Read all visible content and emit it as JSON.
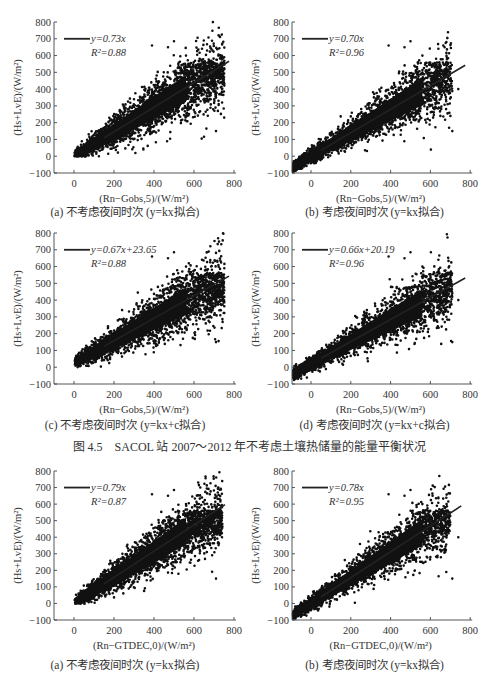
{
  "figures": [
    {
      "caption": "图 4.5　SACOL 站 2007～2012 年不考虑土壤热储量的能量平衡状况"
    }
  ],
  "chart_data": [
    {
      "id": "4.5a",
      "type": "scatter",
      "caption": "(a) 不考虑夜间时次 (y=kx拟合)",
      "xlabel": "(Rn−Gobs,5)/(W/m²)",
      "ylabel": "(Hs+LvE)/(W/m²)",
      "xlim": [
        -90,
        790
      ],
      "ylim": [
        -100,
        800
      ],
      "xticks": [
        0,
        200,
        400,
        600,
        800
      ],
      "yticks": [
        -100,
        0,
        100,
        200,
        300,
        400,
        500,
        600,
        700,
        800
      ],
      "legend": {
        "equation": "y=0.73x",
        "r2": "R²=0.88"
      },
      "fit": {
        "slope": 0.73,
        "intercept": 0,
        "x_range": [
          0,
          775
        ]
      },
      "scatter_extent": {
        "x_min": 0,
        "x_max": 770,
        "y_min": -5,
        "y_max": 690,
        "includes_night": false
      }
    },
    {
      "id": "4.5b",
      "type": "scatter",
      "caption": "(b) 考虑夜间时次 (y=kx拟合)",
      "xlabel": "(Rn−Gobs,5)/(W/m²)",
      "ylabel": "(Hs+LvE)/(W/m²)",
      "xlim": [
        -100,
        800
      ],
      "ylim": [
        -100,
        800
      ],
      "xticks": [
        0,
        200,
        400,
        600,
        800
      ],
      "yticks": [
        -100,
        0,
        100,
        200,
        300,
        400,
        500,
        600,
        700,
        800
      ],
      "legend": {
        "equation": "y=0.70x",
        "r2": "R²=0.96"
      },
      "fit": {
        "slope": 0.7,
        "intercept": 0,
        "x_range": [
          -100,
          775
        ]
      },
      "scatter_extent": {
        "x_min": -100,
        "x_max": 770,
        "y_min": -100,
        "y_max": 690,
        "includes_night": true
      }
    },
    {
      "id": "4.5c",
      "type": "scatter",
      "caption": "(c) 不考虑夜间时次 (y=kx+c拟合)",
      "xlabel": "(Rn−Gobs,5)/(W/m²)",
      "ylabel": "(Hs+LvE)/(W/m²)",
      "xlim": [
        -90,
        790
      ],
      "ylim": [
        -100,
        800
      ],
      "xticks": [
        0,
        200,
        400,
        600,
        800
      ],
      "yticks": [
        -100,
        0,
        100,
        200,
        300,
        400,
        500,
        600,
        700,
        800
      ],
      "legend": {
        "equation": "y=0.67x+23.65",
        "r2": "R²=0.88"
      },
      "fit": {
        "slope": 0.67,
        "intercept": 23.65,
        "x_range": [
          0,
          775
        ]
      },
      "scatter_extent": {
        "x_min": 0,
        "x_max": 770,
        "y_min": -5,
        "y_max": 690,
        "includes_night": false
      }
    },
    {
      "id": "4.5d",
      "type": "scatter",
      "caption": "(d) 考虑夜间时次 (y=kx+c拟合)",
      "xlabel": "(Rn−Gobs,5)/(W/m²)",
      "ylabel": "(Hs+LvE)/(W/m²)",
      "xlim": [
        -100,
        800
      ],
      "ylim": [
        -100,
        800
      ],
      "xticks": [
        0,
        200,
        400,
        600,
        800
      ],
      "yticks": [
        -100,
        0,
        100,
        200,
        300,
        400,
        500,
        600,
        700,
        800
      ],
      "legend": {
        "equation": "y=0.66x+20.19",
        "r2": "R²=0.96"
      },
      "fit": {
        "slope": 0.66,
        "intercept": 20.19,
        "x_range": [
          -100,
          775
        ]
      },
      "scatter_extent": {
        "x_min": -100,
        "x_max": 770,
        "y_min": -100,
        "y_max": 690,
        "includes_night": true
      }
    },
    {
      "id": "4.6a",
      "type": "scatter",
      "caption": "(a) 不考虑夜间时次 (y=kx拟合)",
      "xlabel": "(Rn−GTDEC,0)/(W/m²)",
      "ylabel": "(Hs+LvE)/(W/m²)",
      "xlim": [
        -90,
        790
      ],
      "ylim": [
        -100,
        800
      ],
      "xticks": [
        0,
        200,
        400,
        600,
        800
      ],
      "yticks": [
        -100,
        0,
        100,
        200,
        300,
        400,
        500,
        600,
        700,
        800
      ],
      "legend": {
        "equation": "y=0.79x",
        "r2": "R²=0.87"
      },
      "fit": {
        "slope": 0.79,
        "intercept": 0,
        "x_range": [
          0,
          755
        ]
      },
      "scatter_extent": {
        "x_min": 0,
        "x_max": 760,
        "y_min": -5,
        "y_max": 690,
        "includes_night": false
      }
    },
    {
      "id": "4.6b",
      "type": "scatter",
      "caption": "(b) 考虑夜间时次 (y=kx拟合)",
      "xlabel": "(Rn−GTDEC,0)/(W/m²)",
      "ylabel": "(Hs+LvE)/(W/m²)",
      "xlim": [
        -100,
        800
      ],
      "ylim": [
        -100,
        800
      ],
      "xticks": [
        0,
        200,
        400,
        600,
        800
      ],
      "yticks": [
        -100,
        0,
        100,
        200,
        300,
        400,
        500,
        600,
        700,
        800
      ],
      "legend": {
        "equation": "y=0.78x",
        "r2": "R²=0.95"
      },
      "fit": {
        "slope": 0.78,
        "intercept": 0,
        "x_range": [
          -100,
          755
        ]
      },
      "scatter_extent": {
        "x_min": -100,
        "x_max": 760,
        "y_min": -100,
        "y_max": 690,
        "includes_night": true
      }
    }
  ],
  "labels": {
    "ylabel_parts": {
      "open": "(",
      "H": "H",
      "s": "s",
      "plus": "+L",
      "v": "v",
      "E": "E)/(W/m",
      "sup": "2",
      "close": ")"
    },
    "xlabel_obs": {
      "open": "(",
      "R": "R",
      "n": "n",
      "minus": "−",
      "G": "G",
      "sub": "obs,5",
      "close": ")/(W/m",
      "sup": "2",
      "end": ")"
    },
    "xlabel_tdec": {
      "open": "(",
      "R": "R",
      "n": "n",
      "minus": "−",
      "G": "G",
      "sub": "TDEC,0",
      "close": ")/(W/m",
      "sup": "2",
      "end": ")"
    }
  }
}
